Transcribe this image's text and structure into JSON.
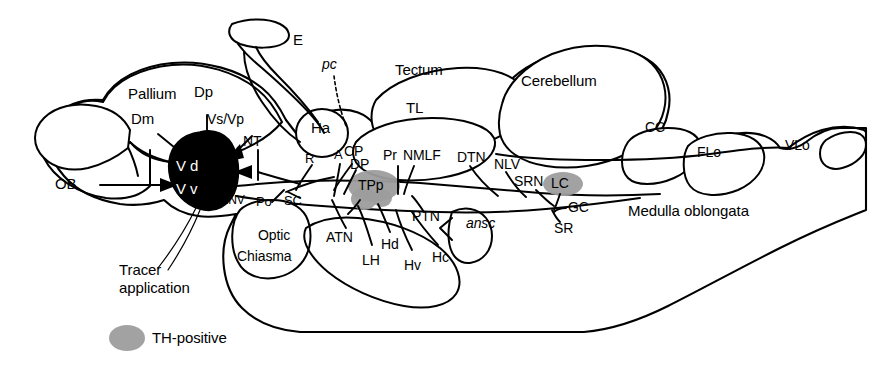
{
  "figure": {
    "kind": "sagittal-brain-schematic",
    "width": 891,
    "height": 370,
    "background": "#ffffff",
    "line_color": "#000000",
    "tracer_fill": "#000000",
    "th_positive_fill": "#9d9d9d"
  },
  "legend": {
    "th_positive_label": "TH-positive"
  },
  "annotations": {
    "tracer_line1": "Tracer",
    "tracer_line2": "application"
  },
  "tracer_region": {
    "dorsal_label": "V d",
    "ventral_label": "V v"
  },
  "regions": {
    "ob": "OB",
    "pallium": "Pallium",
    "dm": "Dm",
    "dp": "Dp",
    "vs_vp": "Vs/Vp",
    "nt": "NT",
    "end_env": "End/ENV",
    "po": "Po",
    "sc": "SC",
    "optic_line1": "Optic",
    "optic_line2": "Chiasma",
    "e": "E",
    "pc": "pc",
    "ha": "Ha",
    "r": "R",
    "a": "A",
    "cp": "CP",
    "dp2": "DP",
    "pr": "Pr",
    "nmlf": "NMLF",
    "tectum": "Tectum",
    "tl": "TL",
    "tpp": "TPp",
    "atn": "ATN",
    "lh": "LH",
    "hd": "Hd",
    "hv": "Hv",
    "hc": "Hc",
    "ptn": "PTN",
    "ansc": "ansc",
    "dtn": "DTN",
    "nlv": "NLV",
    "srn": "SRN",
    "lc": "LC",
    "gc": "GC",
    "sr": "SR",
    "cerebellum": "Cerebellum",
    "cc": "CC",
    "flo": "FLo",
    "vlo": "VLo",
    "medulla": "Medulla oblongata"
  }
}
